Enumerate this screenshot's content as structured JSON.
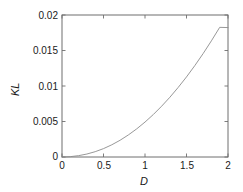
{
  "chart_data": {
    "type": "line",
    "title": "",
    "subtitle": "",
    "xlabel": "D",
    "ylabel": "KL",
    "xlim": [
      0,
      2
    ],
    "ylim": [
      0,
      0.02
    ],
    "grid": false,
    "legend": null,
    "legend_position": "none",
    "xticks": [
      {
        "value": 0,
        "label": "0"
      },
      {
        "value": 0.5,
        "label": "0.5"
      },
      {
        "value": 1,
        "label": "1"
      },
      {
        "value": 1.5,
        "label": "1.5"
      },
      {
        "value": 2,
        "label": "2"
      }
    ],
    "yticks": [
      {
        "value": 0,
        "label": "0"
      },
      {
        "value": 0.005,
        "label": "0.005"
      },
      {
        "value": 0.01,
        "label": "0.01"
      },
      {
        "value": 0.015,
        "label": "0.015"
      },
      {
        "value": 0.02,
        "label": "0.02"
      }
    ],
    "series": [
      {
        "name": "KL divergence",
        "color": "#8c8c8c",
        "line_width": 0.9,
        "x": [
          0.0,
          0.1,
          0.2,
          0.3,
          0.4,
          0.5,
          0.6,
          0.7,
          0.8,
          0.9,
          1.0,
          1.1,
          1.2,
          1.3,
          1.4,
          1.5,
          1.6,
          1.7,
          1.8,
          1.9,
          2.0
        ],
        "y": [
          0.0,
          5e-05,
          0.00019,
          0.00042,
          0.00075,
          0.00118,
          0.00172,
          0.00236,
          0.00311,
          0.00396,
          0.00492,
          0.00598,
          0.00715,
          0.00842,
          0.0098,
          0.01128,
          0.01287,
          0.01456,
          0.01636,
          0.01826,
          0.01823
        ]
      }
    ]
  },
  "axes": {
    "frame_color": "#6e6e6e",
    "background": "#ffffff"
  }
}
